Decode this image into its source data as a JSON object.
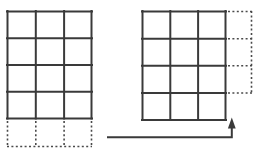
{
  "figure": {
    "title": "",
    "background_color": "#ffffff",
    "solid_line_color": "#3a3a3a",
    "dashed_line_color": "#4a4a4a",
    "arrow_color": "#3a3a3a",
    "solid_stroke_width": 2,
    "dashed_stroke_width": 1.6,
    "dash_pattern": "2,2.4",
    "left_figure": {
      "name": "grid-before",
      "grid": {
        "columns": 3,
        "rows": 4,
        "x0": 7,
        "y0": 11,
        "cell_width": 28.3,
        "cell_height": 26.75
      },
      "dashed_addition": {
        "position": "bottom",
        "columns": 3,
        "rows": 1,
        "height": 26
      }
    },
    "right_figure": {
      "name": "grid-after",
      "grid": {
        "columns": 3,
        "rows": 4,
        "x0": 142,
        "y0": 11,
        "cell_width": 28,
        "cell_height": 27.25
      },
      "dashed_addition": {
        "position": "right",
        "columns": 1,
        "rows": 3,
        "width": 26
      }
    },
    "arrow": {
      "name": "transform-arrow",
      "direction": "right-then-up",
      "x_start": 108,
      "x_end": 232,
      "y_horizontal": 137,
      "y_tip": 118,
      "head_width": 8,
      "head_height": 10
    }
  }
}
